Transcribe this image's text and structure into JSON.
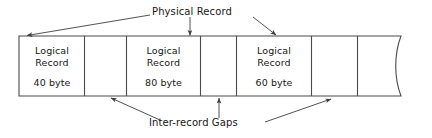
{
  "figure": {
    "colors": {
      "stroke": "#4a4a4a",
      "text": "#171717",
      "background": "#ffffff"
    },
    "callouts": {
      "physical_record": "Physical Record",
      "inter_record_gaps": "Inter-record Gaps"
    },
    "cells": [
      {
        "kind": "logical-record",
        "line1": "Logical",
        "line2": "Record",
        "size": "40 byte"
      },
      {
        "kind": "gap",
        "line1": "",
        "line2": "",
        "size": ""
      },
      {
        "kind": "logical-record",
        "line1": "Logical",
        "line2": "Record",
        "size": "80 byte"
      },
      {
        "kind": "gap",
        "line1": "",
        "line2": "",
        "size": ""
      },
      {
        "kind": "logical-record",
        "line1": "Logical",
        "line2": "Record",
        "size": "60 byte"
      },
      {
        "kind": "gap",
        "line1": "",
        "line2": "",
        "size": ""
      },
      {
        "kind": "continuation",
        "line1": "",
        "line2": "",
        "size": ""
      }
    ]
  }
}
